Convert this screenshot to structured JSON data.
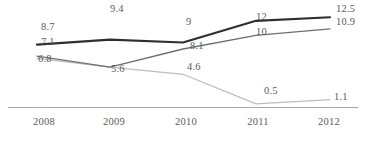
{
  "chart_data": {
    "type": "line",
    "title": "",
    "xlabel": "",
    "ylabel": "",
    "categories": [
      "2008",
      "2009",
      "2010",
      "2011",
      "2012"
    ],
    "grid": false,
    "legend": "none",
    "ylim": [
      0,
      13.5
    ],
    "series": [
      {
        "name": "series-dark",
        "color": "#2f2f2f",
        "width": 2.1,
        "values": [
          8.7,
          9.4,
          9,
          12,
          12.5
        ],
        "labels": [
          "8.7",
          "9.4",
          "9",
          "12",
          "12.5"
        ]
      },
      {
        "name": "series-medium",
        "color": "#6e6e6e",
        "width": 1.3,
        "values": [
          7.1,
          5.6,
          8.1,
          10,
          10.9
        ],
        "labels": [
          "7.1",
          "5.6",
          "8.1",
          "10",
          "10.9"
        ]
      },
      {
        "name": "series-light",
        "color": "#bdbdbd",
        "width": 1.2,
        "values": [
          6.8,
          5.6,
          4.6,
          0.5,
          1.1
        ],
        "labels": [
          "6.8",
          "5.6",
          "4.6",
          "0.5",
          "1.1"
        ]
      }
    ],
    "axis_color": "#a6a6a6",
    "text_color": "#5b5b5b"
  },
  "axis": {
    "ticks": [
      {
        "label": "2008",
        "x": 44
      },
      {
        "label": "2009",
        "x": 114
      },
      {
        "label": "2010",
        "x": 186
      },
      {
        "label": "2011",
        "x": 258
      },
      {
        "label": "2012",
        "x": 329
      }
    ]
  },
  "labels": [
    {
      "name": "label-dark-2008",
      "text": "8.7",
      "x": 41,
      "y": 22
    },
    {
      "name": "label-dark-2009",
      "text": "9.4",
      "x": 110,
      "y": 4
    },
    {
      "name": "label-dark-2010",
      "text": "9",
      "x": 186,
      "y": 17
    },
    {
      "name": "label-dark-2011",
      "text": "12",
      "x": 256,
      "y": 12
    },
    {
      "name": "label-dark-2012",
      "text": "12.5",
      "x": 336,
      "y": 4
    },
    {
      "name": "label-medium-2008",
      "text": "7.1",
      "x": 41,
      "y": 37
    },
    {
      "name": "label-medium-2010",
      "text": "8.1",
      "x": 190,
      "y": 41
    },
    {
      "name": "label-medium-2011",
      "text": "10",
      "x": 256,
      "y": 27
    },
    {
      "name": "label-medium-2012",
      "text": "10.9",
      "x": 336,
      "y": 17
    },
    {
      "name": "label-light-2008",
      "text": "6.8",
      "x": 38,
      "y": 54
    },
    {
      "name": "label-shared-2009",
      "text": "5.6",
      "x": 111,
      "y": 64
    },
    {
      "name": "label-light-2010",
      "text": "4.6",
      "x": 187,
      "y": 62
    },
    {
      "name": "label-light-2011",
      "text": "0.5",
      "x": 264,
      "y": 86
    },
    {
      "name": "label-light-2012",
      "text": "1.1",
      "x": 334,
      "y": 92
    }
  ]
}
